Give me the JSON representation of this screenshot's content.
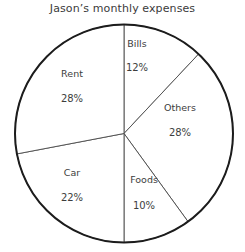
{
  "chart_data": {
    "type": "pie",
    "title": "Jason’s monthly expenses",
    "xlabel": "",
    "ylabel": "",
    "legend": "none",
    "grid": false,
    "start_angle_deg": 0,
    "direction": "clockwise",
    "categories": [
      "Bills",
      "Others",
      "Foods",
      "Car",
      "Rent"
    ],
    "values": [
      12,
      28,
      10,
      22,
      28
    ],
    "units": "percent",
    "total": 100,
    "slices": [
      {
        "label": "Bills",
        "value": 12,
        "value_label": "12%",
        "start_deg": 0,
        "end_deg": 43.2,
        "label_x": 137,
        "label_y": 47,
        "value_x": 137,
        "value_y": 71
      },
      {
        "label": "Others",
        "value": 28,
        "value_label": "28%",
        "start_deg": 43.2,
        "end_deg": 144,
        "label_x": 180,
        "label_y": 111,
        "value_x": 180,
        "value_y": 136
      },
      {
        "label": "Foods",
        "value": 10,
        "value_label": "10%",
        "start_deg": 144,
        "end_deg": 180,
        "label_x": 144,
        "label_y": 183,
        "value_x": 144,
        "value_y": 209
      },
      {
        "label": "Car",
        "value": 22,
        "value_label": "22%",
        "start_deg": 180,
        "end_deg": 259.2,
        "label_x": 72,
        "label_y": 176,
        "value_x": 72,
        "value_y": 201
      },
      {
        "label": "Rent",
        "value": 28,
        "value_label": "28%",
        "start_deg": 259.2,
        "end_deg": 360,
        "label_x": 72,
        "label_y": 77,
        "value_x": 72,
        "value_y": 102
      }
    ],
    "geometry": {
      "center_x": 124,
      "center_y": 133.5,
      "radius": 109
    },
    "colors": {
      "background": "#ffffff",
      "slice_fill": "#ffffff",
      "slice_divider": "#4a4a4a",
      "outline": "#1c1c1c",
      "title_text": "#3b3b3b",
      "label_text": "#3d3d3d"
    }
  }
}
